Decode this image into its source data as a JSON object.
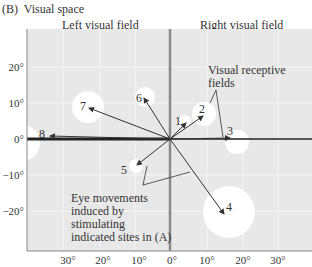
{
  "panel_label": "(B)",
  "title": "Visual space",
  "field_labels": {
    "left": "Left visual field",
    "right": "Right visual field"
  },
  "axes": {
    "x_ticks": [
      "30°",
      "20°",
      "10°",
      "0°",
      "10°",
      "20°",
      "30°"
    ],
    "y_ticks": [
      "20°",
      "10°",
      "0°",
      "−10°",
      "−20°"
    ]
  },
  "annotations": {
    "receptive_fields_line1": "Visual receptive",
    "receptive_fields_line2": "fields",
    "eye_movements_line1": "Eye movements",
    "eye_movements_line2": "induced by",
    "eye_movements_line3": "stimulating",
    "eye_movements_line4": "indicated sites in (A)"
  },
  "sites": [
    {
      "id": "1",
      "label": "1"
    },
    {
      "id": "2",
      "label": "2"
    },
    {
      "id": "3",
      "label": "3"
    },
    {
      "id": "4",
      "label": "4"
    },
    {
      "id": "5",
      "label": "5"
    },
    {
      "id": "6",
      "label": "6"
    },
    {
      "id": "7",
      "label": "7"
    },
    {
      "id": "8",
      "label": "8"
    }
  ],
  "colors": {
    "plot_background": "#e8e8e8",
    "grid": "#f4f4f4",
    "receptive_field": "#ffffff",
    "vertical_axis": "#8a8a8a",
    "horizontal_axis": "#222222",
    "arrow": "#333333"
  }
}
